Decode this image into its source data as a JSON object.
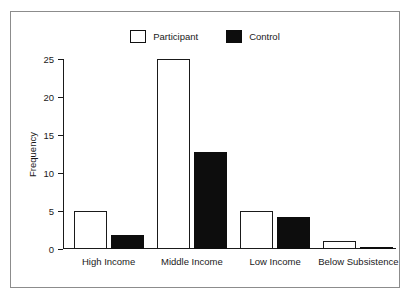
{
  "chart_data": {
    "type": "bar",
    "title": "",
    "xlabel": "",
    "ylabel": "Frequency",
    "ylim": [
      0,
      25
    ],
    "yticks": [
      0,
      5,
      10,
      15,
      20,
      25
    ],
    "ytick_labels": [
      "0",
      "5",
      "10",
      "15",
      "20",
      "25"
    ],
    "grid": false,
    "legend_position": "top-center",
    "categories": [
      "High Income",
      "Middle Income",
      "Low Income",
      "Below Subsistence"
    ],
    "series": [
      {
        "name": "Participant",
        "color": "#ffffff",
        "edge_color": "#1a1a1a",
        "values": [
          5,
          25,
          5,
          1
        ]
      },
      {
        "name": "Control",
        "color": "#0d0d0d",
        "edge_color": "#0d0d0d",
        "values": [
          1.8,
          12.7,
          4.2,
          0.3
        ]
      }
    ]
  },
  "figure": {
    "frame_color": "#8c8c8c",
    "background": "#ffffff",
    "axis_color": "#1a1a1a"
  }
}
